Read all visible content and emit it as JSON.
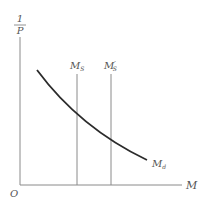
{
  "diagram": {
    "type": "money-market-diagram",
    "y_axis_label": {
      "numerator": "1",
      "denominator": "P"
    },
    "x_axis_label": "M",
    "origin_label": "O",
    "supply_lines": [
      {
        "label": "M",
        "subscript": "S",
        "prime": false,
        "x": 77
      },
      {
        "label": "M",
        "subscript": "S",
        "prime": true,
        "x": 111
      }
    ],
    "demand_curve": {
      "label": "M",
      "subscript": "d"
    },
    "colors": {
      "axes": "#8a8a8a",
      "supply": "#8a8a8a",
      "demand": "#2b2b2b",
      "text": "#555555"
    }
  }
}
